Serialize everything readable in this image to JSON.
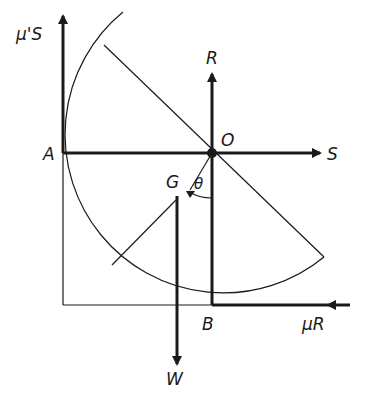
{
  "diagram": {
    "type": "force-diagram",
    "colors": {
      "ink": "#1a1a1a",
      "background": "#ffffff"
    },
    "labels": {
      "mu_s": "μ'S",
      "A": "A",
      "R": "R",
      "O": "O",
      "S": "S",
      "G": "G",
      "theta": "θ",
      "B": "B",
      "mu_r": "μR",
      "W": "W"
    },
    "points": {
      "O": [
        212,
        153
      ],
      "A": [
        63,
        153
      ],
      "B": [
        212,
        305
      ],
      "G": [
        178,
        196
      ]
    },
    "forces": [
      {
        "name": "μ'S",
        "at": "A",
        "direction": "up"
      },
      {
        "name": "R",
        "at": "B",
        "direction": "up"
      },
      {
        "name": "S",
        "at": "A",
        "direction": "right"
      },
      {
        "name": "μR",
        "at": "B",
        "direction": "left"
      },
      {
        "name": "W",
        "at": "G",
        "direction": "down"
      }
    ]
  }
}
